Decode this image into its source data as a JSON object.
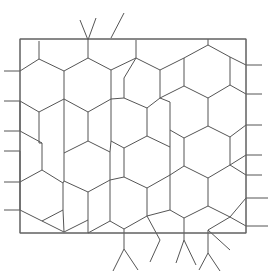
{
  "figure": {
    "type": "mesh-diagram",
    "background_color": "#ffffff",
    "canvas": {
      "width": 272,
      "height": 273
    }
  },
  "style": {
    "mesh_line_color": "#555555",
    "mesh_line_width": 1,
    "boundary_line_color": "#666666",
    "boundary_line_width": 1,
    "stub_line_color": "#555555",
    "stub_line_width": 1
  },
  "boundary": {
    "label": "domain-rectangle",
    "x": 20,
    "y": 39,
    "width": 226,
    "height": 194
  },
  "mesh": {
    "description": "Perturbed honeycomb lattice of hexagonal cells clipped by the rectangle",
    "cell_count": 44,
    "edges": [
      [
        20,
        39,
        246,
        39
      ],
      [
        246,
        39,
        246,
        233
      ],
      [
        246,
        233,
        20,
        233
      ],
      [
        20,
        233,
        20,
        39
      ],
      [
        20,
        71,
        39,
        59
      ],
      [
        39,
        59,
        64,
        71
      ],
      [
        64,
        71,
        64,
        99
      ],
      [
        64,
        99,
        39,
        112
      ],
      [
        39,
        112,
        20,
        101
      ],
      [
        20,
        101,
        20,
        131
      ],
      [
        20,
        131,
        42,
        143
      ],
      [
        42,
        143,
        42,
        170
      ],
      [
        42,
        170,
        20,
        182
      ],
      [
        20,
        182,
        20,
        151
      ],
      [
        39,
        112,
        39,
        143
      ],
      [
        39,
        143,
        42,
        143
      ],
      [
        42,
        170,
        63,
        183
      ],
      [
        63,
        183,
        63,
        210
      ],
      [
        63,
        210,
        42,
        221
      ],
      [
        42,
        221,
        20,
        210
      ],
      [
        20,
        210,
        20,
        182
      ],
      [
        39,
        59,
        39,
        41
      ],
      [
        64,
        71,
        88,
        58
      ],
      [
        88,
        58,
        88,
        40
      ],
      [
        88,
        58,
        111,
        70
      ],
      [
        111,
        70,
        111,
        99
      ],
      [
        111,
        99,
        88,
        112
      ],
      [
        88,
        112,
        64,
        99
      ],
      [
        88,
        112,
        88,
        141
      ],
      [
        88,
        141,
        64,
        153
      ],
      [
        64,
        153,
        64,
        125
      ],
      [
        64,
        125,
        64,
        99
      ],
      [
        64,
        153,
        64,
        181
      ],
      [
        64,
        181,
        63,
        183
      ],
      [
        88,
        141,
        110,
        152
      ],
      [
        110,
        152,
        110,
        180
      ],
      [
        110,
        180,
        88,
        192
      ],
      [
        88,
        192,
        64,
        181
      ],
      [
        88,
        192,
        88,
        220
      ],
      [
        88,
        220,
        64,
        232
      ],
      [
        64,
        232,
        63,
        210
      ],
      [
        111,
        70,
        136,
        58
      ],
      [
        136,
        58,
        136,
        40
      ],
      [
        136,
        58,
        124,
        78
      ],
      [
        124,
        78,
        124,
        98
      ],
      [
        124,
        98,
        111,
        99
      ],
      [
        124,
        98,
        147,
        108
      ],
      [
        147,
        108,
        147,
        136
      ],
      [
        147,
        136,
        124,
        148
      ],
      [
        124,
        148,
        111,
        141
      ],
      [
        111,
        141,
        111,
        99
      ],
      [
        111,
        141,
        110,
        152
      ],
      [
        147,
        136,
        170,
        147
      ],
      [
        170,
        147,
        170,
        175
      ],
      [
        170,
        175,
        147,
        188
      ],
      [
        147,
        188,
        124,
        177
      ],
      [
        124,
        177,
        124,
        148
      ],
      [
        124,
        177,
        110,
        180
      ],
      [
        147,
        188,
        147,
        216
      ],
      [
        147,
        216,
        124,
        229
      ],
      [
        124,
        229,
        110,
        221
      ],
      [
        110,
        221,
        110,
        180
      ],
      [
        124,
        229,
        124,
        249
      ],
      [
        136,
        58,
        160,
        70
      ],
      [
        160,
        70,
        160,
        98
      ],
      [
        160,
        98,
        147,
        108
      ],
      [
        160,
        98,
        184,
        86
      ],
      [
        184,
        86,
        184,
        58
      ],
      [
        184,
        58,
        160,
        70
      ],
      [
        184,
        58,
        208,
        45
      ],
      [
        208,
        45,
        208,
        39
      ],
      [
        208,
        45,
        230,
        57
      ],
      [
        230,
        57,
        230,
        85
      ],
      [
        230,
        85,
        246,
        94
      ],
      [
        230,
        85,
        208,
        98
      ],
      [
        208,
        98,
        184,
        86
      ],
      [
        208,
        98,
        208,
        126
      ],
      [
        208,
        126,
        184,
        138
      ],
      [
        184,
        138,
        170,
        130
      ],
      [
        170,
        130,
        170,
        102
      ],
      [
        170,
        102,
        160,
        98
      ],
      [
        170,
        130,
        170,
        147
      ],
      [
        208,
        126,
        230,
        137
      ],
      [
        230,
        137,
        230,
        165
      ],
      [
        230,
        165,
        246,
        175
      ],
      [
        230,
        165,
        208,
        178
      ],
      [
        208,
        178,
        184,
        166
      ],
      [
        184,
        166,
        184,
        138
      ],
      [
        184,
        166,
        170,
        175
      ],
      [
        208,
        178,
        208,
        206
      ],
      [
        208,
        206,
        184,
        218
      ],
      [
        184,
        218,
        170,
        210
      ],
      [
        170,
        210,
        170,
        175
      ],
      [
        184,
        218,
        184,
        240
      ],
      [
        208,
        206,
        230,
        217
      ],
      [
        230,
        217,
        246,
        226
      ],
      [
        230,
        217,
        208,
        230
      ],
      [
        208,
        230,
        208,
        253
      ],
      [
        246,
        125,
        230,
        137
      ],
      [
        246,
        198,
        230,
        217
      ],
      [
        246,
        65,
        230,
        57
      ],
      [
        246,
        155,
        230,
        165
      ],
      [
        170,
        210,
        147,
        216
      ],
      [
        160,
        240,
        147,
        216
      ],
      [
        230,
        250,
        208,
        230
      ],
      [
        64,
        232,
        42,
        221
      ],
      [
        88,
        220,
        88,
        233
      ],
      [
        88,
        233,
        110,
        221
      ],
      [
        20,
        71,
        4,
        71
      ],
      [
        20,
        101,
        4,
        101
      ],
      [
        20,
        131,
        4,
        131
      ],
      [
        20,
        151,
        4,
        151
      ],
      [
        20,
        182,
        4,
        182
      ],
      [
        20,
        210,
        4,
        210
      ],
      [
        246,
        65,
        262,
        65
      ],
      [
        246,
        94,
        262,
        94
      ],
      [
        246,
        125,
        262,
        125
      ],
      [
        246,
        155,
        262,
        155
      ],
      [
        246,
        175,
        262,
        175
      ],
      [
        246,
        198,
        268,
        198
      ],
      [
        246,
        226,
        268,
        226
      ],
      [
        88,
        40,
        96,
        18
      ],
      [
        88,
        40,
        80,
        20
      ],
      [
        111,
        38,
        124,
        13
      ],
      [
        124,
        249,
        113,
        271
      ],
      [
        124,
        249,
        138,
        270
      ],
      [
        160,
        240,
        150,
        262
      ],
      [
        184,
        240,
        176,
        263
      ],
      [
        184,
        240,
        196,
        265
      ],
      [
        208,
        253,
        220,
        271
      ],
      [
        208,
        253,
        199,
        270
      ]
    ],
    "external_stubs": {
      "left_count": 6,
      "right_count": 7,
      "top_count": 3,
      "bottom_count": 7
    }
  },
  "chart_data": {
    "type": "diagram",
    "xlabel": "",
    "ylabel": "",
    "xlim": [
      0,
      272
    ],
    "ylim": [
      0,
      273
    ],
    "grid": false,
    "legend": "none",
    "annotations": []
  }
}
